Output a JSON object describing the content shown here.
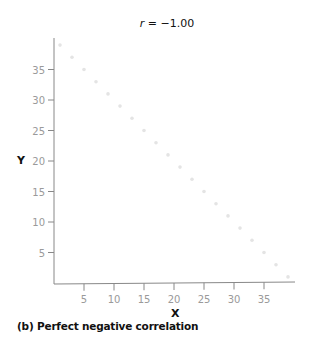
{
  "chart_data": {
    "type": "scatter",
    "title": "r = −1.00",
    "title_var": "r",
    "title_value": "= −1.00",
    "xlabel": "X",
    "ylabel": "Y",
    "caption": "(b) Perfect negative correlation",
    "xlim": [
      0,
      40
    ],
    "ylim": [
      0,
      40
    ],
    "x_ticks": [
      5,
      10,
      15,
      20,
      25,
      30,
      35
    ],
    "y_ticks": [
      5,
      10,
      15,
      20,
      25,
      30,
      35
    ],
    "grid": false,
    "legend": null,
    "series": [
      {
        "name": "points",
        "description": "Points lying exactly on the line Y = 40 - X",
        "x": [
          1,
          3,
          5,
          7,
          9,
          11,
          13,
          15,
          17,
          19,
          21,
          23,
          25,
          27,
          29,
          31,
          33,
          35,
          37,
          39
        ],
        "y": [
          39,
          37,
          35,
          33,
          31,
          29,
          27,
          25,
          23,
          21,
          19,
          17,
          15,
          13,
          11,
          9,
          7,
          5,
          3,
          1
        ],
        "color": "#e4e4e4"
      }
    ]
  },
  "colors": {
    "axis": "#888888",
    "tick_label": "#9a9a9a",
    "text": "#111111",
    "points": "#e4e4e4"
  }
}
